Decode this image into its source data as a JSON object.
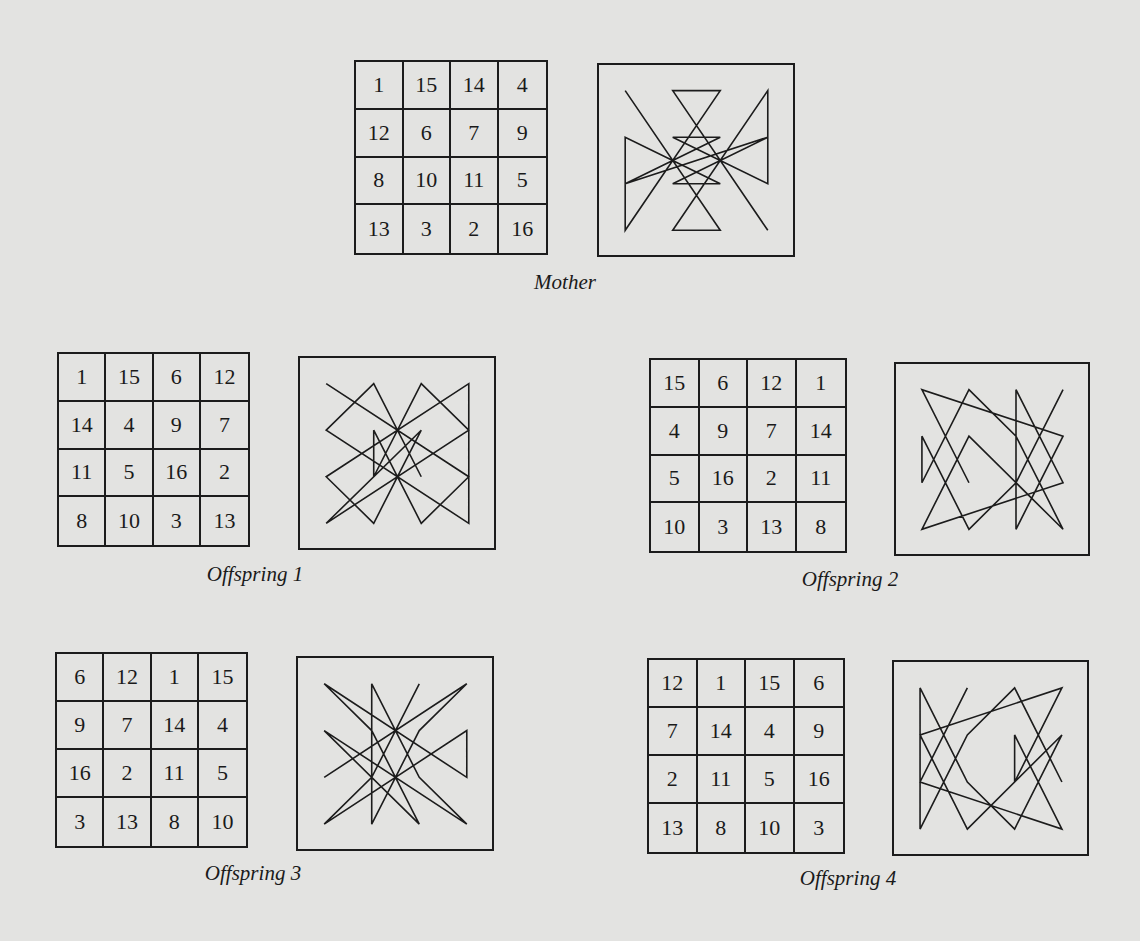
{
  "figure": {
    "panels": [
      {
        "id": "mother",
        "label": "Mother",
        "grid": [
          [
            1,
            15,
            14,
            4
          ],
          [
            12,
            6,
            7,
            9
          ],
          [
            8,
            10,
            11,
            5
          ],
          [
            13,
            3,
            2,
            16
          ]
        ],
        "layout": {
          "grid": [
            354,
            60,
            194,
            195
          ],
          "box": [
            597,
            63,
            198,
            194
          ],
          "caption": [
            565,
            270
          ]
        }
      },
      {
        "id": "offspring-1",
        "label": "Offspring 1",
        "grid": [
          [
            1,
            15,
            6,
            12
          ],
          [
            14,
            4,
            9,
            7
          ],
          [
            11,
            5,
            16,
            2
          ],
          [
            8,
            10,
            3,
            13
          ]
        ],
        "layout": {
          "grid": [
            57,
            352,
            193,
            195
          ],
          "box": [
            298,
            356,
            198,
            194
          ],
          "caption": [
            255,
            562
          ]
        }
      },
      {
        "id": "offspring-2",
        "label": "Offspring 2",
        "grid": [
          [
            15,
            6,
            12,
            1
          ],
          [
            4,
            9,
            7,
            14
          ],
          [
            5,
            16,
            2,
            11
          ],
          [
            10,
            3,
            13,
            8
          ]
        ],
        "layout": {
          "grid": [
            649,
            358,
            198,
            195
          ],
          "box": [
            894,
            362,
            196,
            194
          ],
          "caption": [
            850,
            567
          ]
        }
      },
      {
        "id": "offspring-3",
        "label": "Offspring 3",
        "grid": [
          [
            6,
            12,
            1,
            15
          ],
          [
            9,
            7,
            14,
            4
          ],
          [
            16,
            2,
            11,
            5
          ],
          [
            3,
            13,
            8,
            10
          ]
        ],
        "layout": {
          "grid": [
            55,
            652,
            193,
            196
          ],
          "box": [
            296,
            656,
            198,
            195
          ],
          "caption": [
            253,
            861
          ]
        }
      },
      {
        "id": "offspring-4",
        "label": "Offspring 4",
        "grid": [
          [
            12,
            1,
            15,
            6
          ],
          [
            7,
            14,
            4,
            9
          ],
          [
            2,
            11,
            5,
            16
          ],
          [
            13,
            8,
            10,
            3
          ]
        ],
        "layout": {
          "grid": [
            647,
            658,
            198,
            196
          ],
          "box": [
            892,
            660,
            197,
            196
          ],
          "caption": [
            848,
            866
          ]
        }
      }
    ],
    "style": {
      "background": "#e3e3e1",
      "ink": "#1c1c1c"
    }
  }
}
